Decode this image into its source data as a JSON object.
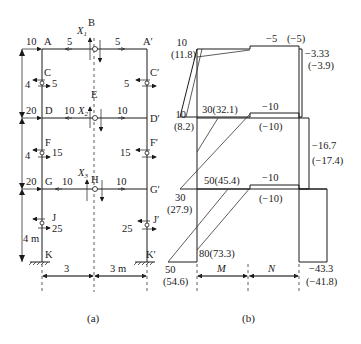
{
  "figure_a": {
    "caption": "(a)",
    "nodes": {
      "A": "A",
      "A_prime": "A′",
      "B": "B",
      "C": "C",
      "C_prime": "C′",
      "D": "D",
      "D_prime": "D′",
      "E": "E",
      "F": "F",
      "F_prime": "F′",
      "G": "G",
      "G_prime": "G′",
      "H": "H",
      "J": "J",
      "J_prime": "J′",
      "K": "K",
      "K_prime": "K′"
    },
    "redundants": {
      "X1": "X",
      "X1_sub": "1",
      "X2": "X",
      "X2_sub": "2",
      "X3": "X",
      "X3_sub": "3"
    },
    "loads": {
      "top_left": "10",
      "mid_left": "20",
      "low_left": "20",
      "AB": "5",
      "BA_prime": "5",
      "DE": "10",
      "ED_prime": "10",
      "GH": "10",
      "HG_prime": "10",
      "C": "5",
      "C_prime": "5",
      "F": "15",
      "F_prime": "15",
      "J": "25",
      "J_prime": "25"
    },
    "dimensions": {
      "h1": "4",
      "h2": "4",
      "h3": "4 m",
      "w_left": "3",
      "w_right": "3 m"
    }
  },
  "figure_b": {
    "caption": "(b)",
    "column_labels": {
      "M": "M",
      "N": "N"
    },
    "values": {
      "top_left": "10",
      "top_left_alt": "(11.8)",
      "top_right": "−5",
      "top_right_alt": "(−5)",
      "top_N": "−3.33",
      "top_N_alt": "(−3.9)",
      "mid_left": "10",
      "mid_left_alt": "(8.2)",
      "mid_M": "30(32.1)",
      "mid_right": "−10",
      "mid_right_alt": "(−10)",
      "mid_N": "−16.7",
      "mid_N_alt": "(−17.4)",
      "low_left": "30",
      "low_left_alt": "(27.9)",
      "low_M": "50(45.4)",
      "low_right": "−10",
      "low_right_alt": "(−10)",
      "base_left": "50",
      "base_left_alt": "(54.6)",
      "base_M": "80(73.3)",
      "base_N": "−43.3",
      "base_N_alt": "(−41.8)"
    }
  }
}
